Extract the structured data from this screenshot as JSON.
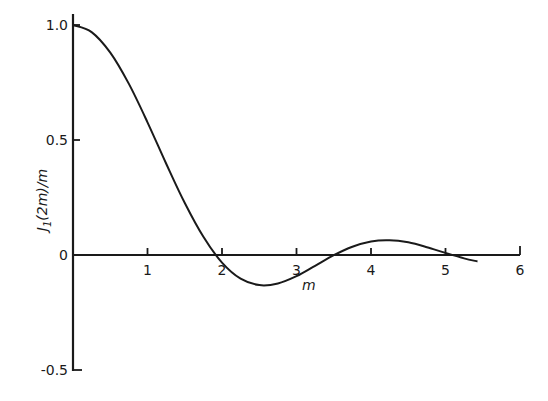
{
  "chart_data": {
    "type": "line",
    "title": "",
    "xlabel": "m",
    "ylabel": "J1(2m)/m",
    "ylabel_parts": {
      "j": "J",
      "sub": "1",
      "rest": "(2m)/m"
    },
    "xlim": [
      0,
      6
    ],
    "ylim": [
      -0.5,
      1.0
    ],
    "grid": false,
    "legend": null,
    "x_ticks": [
      "1",
      "2",
      "3",
      "4",
      "5",
      "6"
    ],
    "y_ticks": [
      "1.0",
      "0.5",
      "0",
      "-0.5"
    ],
    "y_tick_values": [
      1.0,
      0.5,
      0,
      -0.5
    ],
    "x_tick_values": [
      1,
      2,
      3,
      4,
      5,
      6
    ],
    "series": [
      {
        "name": "J1(2m)/m",
        "x": [
          0,
          0.25,
          0.5,
          0.75,
          1.0,
          1.25,
          1.5,
          1.75,
          2.0,
          2.25,
          2.5,
          2.75,
          3.0,
          3.25,
          3.5,
          3.75,
          4.0,
          4.25,
          4.5,
          4.75,
          5.0,
          5.25,
          5.43
        ],
        "values": [
          1.0,
          0.969,
          0.88,
          0.744,
          0.577,
          0.398,
          0.226,
          0.079,
          -0.033,
          -0.103,
          -0.131,
          -0.124,
          -0.092,
          -0.047,
          -0.001,
          0.036,
          0.059,
          0.064,
          0.055,
          0.034,
          0.009,
          -0.015,
          -0.028
        ]
      }
    ]
  }
}
